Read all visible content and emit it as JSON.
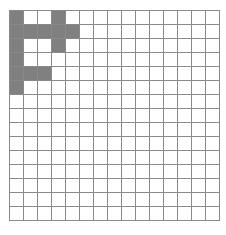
{
  "canvas": {
    "width": 226,
    "height": 235,
    "background_color": "#ffffff"
  },
  "grid": {
    "name": "pixel-grid",
    "columns": 15,
    "rows": 15,
    "cell_size_px": 14,
    "origin_x_px": 9,
    "origin_y_px": 10,
    "line_color": "#8a8a8a",
    "line_width_px": 1,
    "empty_cell_color": "#ffffff",
    "filled_cell_color": "#808080",
    "filled_cells": [
      [
        0,
        0
      ],
      [
        0,
        3
      ],
      [
        1,
        0
      ],
      [
        1,
        1
      ],
      [
        1,
        2
      ],
      [
        1,
        3
      ],
      [
        1,
        4
      ],
      [
        2,
        0
      ],
      [
        2,
        3
      ],
      [
        3,
        0
      ],
      [
        4,
        0
      ],
      [
        4,
        1
      ],
      [
        4,
        2
      ],
      [
        5,
        0
      ]
    ],
    "filled_count": 14
  },
  "chart_data": {
    "type": "heatmap",
    "title": "",
    "xlabel": "",
    "ylabel": "",
    "grid": true,
    "legend": "none",
    "categories_x": [
      "0",
      "1",
      "2",
      "3",
      "4",
      "5",
      "6",
      "7",
      "8",
      "9",
      "10",
      "11",
      "12",
      "13",
      "14"
    ],
    "categories_y": [
      "0",
      "1",
      "2",
      "3",
      "4",
      "5",
      "6",
      "7",
      "8",
      "9",
      "10",
      "11",
      "12",
      "13",
      "14"
    ],
    "value_legend": {
      "0": "#ffffff",
      "1": "#808080"
    },
    "values": [
      [
        1,
        0,
        0,
        1,
        0,
        0,
        0,
        0,
        0,
        0,
        0,
        0,
        0,
        0,
        0
      ],
      [
        1,
        1,
        1,
        1,
        1,
        0,
        0,
        0,
        0,
        0,
        0,
        0,
        0,
        0,
        0
      ],
      [
        1,
        0,
        0,
        1,
        0,
        0,
        0,
        0,
        0,
        0,
        0,
        0,
        0,
        0,
        0
      ],
      [
        1,
        0,
        0,
        0,
        0,
        0,
        0,
        0,
        0,
        0,
        0,
        0,
        0,
        0,
        0
      ],
      [
        1,
        1,
        1,
        0,
        0,
        0,
        0,
        0,
        0,
        0,
        0,
        0,
        0,
        0,
        0
      ],
      [
        1,
        0,
        0,
        0,
        0,
        0,
        0,
        0,
        0,
        0,
        0,
        0,
        0,
        0,
        0
      ],
      [
        0,
        0,
        0,
        0,
        0,
        0,
        0,
        0,
        0,
        0,
        0,
        0,
        0,
        0,
        0
      ],
      [
        0,
        0,
        0,
        0,
        0,
        0,
        0,
        0,
        0,
        0,
        0,
        0,
        0,
        0,
        0
      ],
      [
        0,
        0,
        0,
        0,
        0,
        0,
        0,
        0,
        0,
        0,
        0,
        0,
        0,
        0,
        0
      ],
      [
        0,
        0,
        0,
        0,
        0,
        0,
        0,
        0,
        0,
        0,
        0,
        0,
        0,
        0,
        0
      ],
      [
        0,
        0,
        0,
        0,
        0,
        0,
        0,
        0,
        0,
        0,
        0,
        0,
        0,
        0,
        0
      ],
      [
        0,
        0,
        0,
        0,
        0,
        0,
        0,
        0,
        0,
        0,
        0,
        0,
        0,
        0,
        0
      ],
      [
        0,
        0,
        0,
        0,
        0,
        0,
        0,
        0,
        0,
        0,
        0,
        0,
        0,
        0,
        0
      ],
      [
        0,
        0,
        0,
        0,
        0,
        0,
        0,
        0,
        0,
        0,
        0,
        0,
        0,
        0,
        0
      ],
      [
        0,
        0,
        0,
        0,
        0,
        0,
        0,
        0,
        0,
        0,
        0,
        0,
        0,
        0,
        0
      ]
    ]
  }
}
